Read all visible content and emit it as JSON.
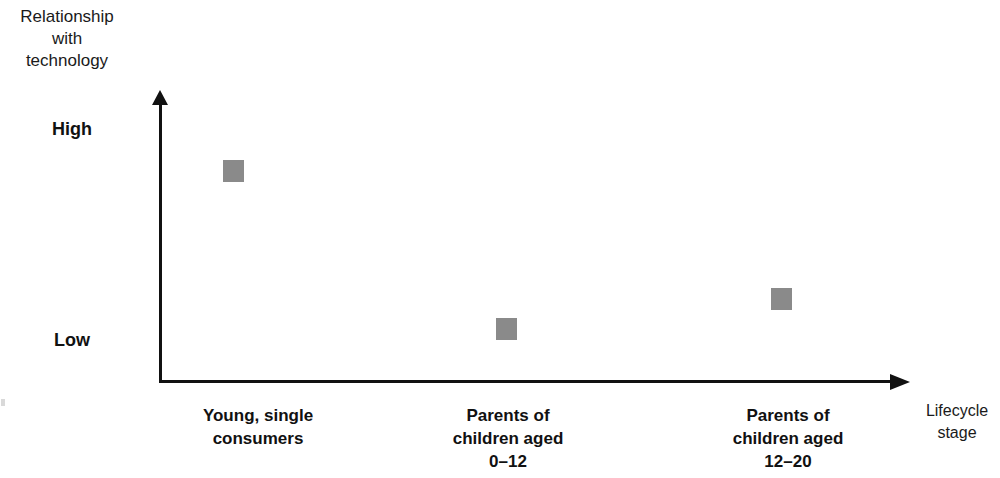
{
  "chart_data": {
    "type": "scatter",
    "title": "",
    "ylabel": "Relationship\nwith\ntechnology",
    "xlabel": "Lifecycle\nstage",
    "ytick_labels": [
      "High",
      "Low"
    ],
    "ylim": [
      "Low",
      "High"
    ],
    "grid": false,
    "legend": "none",
    "marker_shape": "square",
    "marker_color": "#8a8a8a",
    "categories": [
      "Young, single\nconsumers",
      "Parents of\nchildren aged\n0–12",
      "Parents of\nchildren aged\n12–20"
    ],
    "points": [
      {
        "category": "Young, single consumers",
        "value_label": "High",
        "x_px": 233,
        "y_px": 171
      },
      {
        "category": "Parents of children aged 0–12",
        "value_label": "Low",
        "x_px": 506,
        "y_px": 329
      },
      {
        "category": "Parents of children aged 12–20",
        "value_label": "Low-to-mid",
        "x_px": 781,
        "y_px": 299
      }
    ],
    "series": [
      {
        "name": "Relationship with technology",
        "values": [
          0.84,
          0.18,
          0.29
        ]
      }
    ]
  },
  "axes": {
    "y_title": "Relationship\nwith\ntechnology",
    "x_title": "Lifecycle\nstage",
    "y_high_label": "High",
    "y_low_label": "Low"
  },
  "categories": {
    "c1": "Young, single\nconsumers",
    "c2": "Parents of\nchildren aged\n0–12",
    "c3": "Parents of\nchildren aged\n12–20"
  },
  "colors": {
    "marker": "#8a8a8a",
    "axis": "#111111",
    "text": "#1a1a1a",
    "background": "#ffffff"
  }
}
